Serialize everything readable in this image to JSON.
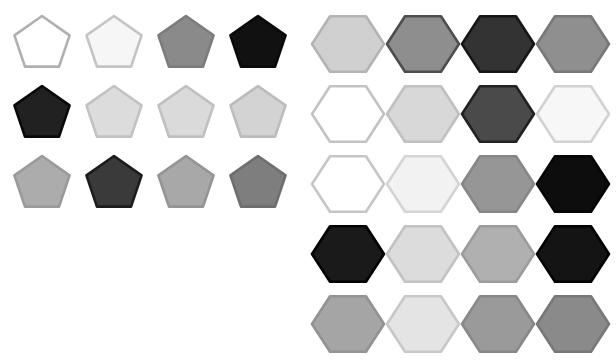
{
  "canvas": {
    "width": 616,
    "height": 362,
    "background": "#ffffff"
  },
  "shape_grids": [
    {
      "name": "pentagon-grid",
      "shape": "pentagon",
      "sides": 5,
      "rows": 3,
      "cols": 4,
      "origin_x": 13,
      "origin_y": 16,
      "cell_w": 72,
      "cell_h": 70,
      "shape_w": 58,
      "shape_h": 56,
      "stroke_width": 2.6,
      "cells": [
        {
          "row": 0,
          "col": 0,
          "fill": "#ffffff",
          "stroke": "#b0b0b0",
          "label": "pentagon-r1c1"
        },
        {
          "row": 0,
          "col": 1,
          "fill": "#f6f6f6",
          "stroke": "#c4c4c4",
          "label": "pentagon-r1c2"
        },
        {
          "row": 0,
          "col": 2,
          "fill": "#8a8a8a",
          "stroke": "#7c7c7c",
          "label": "pentagon-r1c3"
        },
        {
          "row": 0,
          "col": 3,
          "fill": "#111111",
          "stroke": "#0a0a0a",
          "label": "pentagon-r1c4"
        },
        {
          "row": 1,
          "col": 0,
          "fill": "#212121",
          "stroke": "#090909",
          "label": "pentagon-r2c1"
        },
        {
          "row": 1,
          "col": 1,
          "fill": "#dcdcdc",
          "stroke": "#c2c2c2",
          "label": "pentagon-r2c2"
        },
        {
          "row": 1,
          "col": 2,
          "fill": "#dadada",
          "stroke": "#c0c0c0",
          "label": "pentagon-r2c3"
        },
        {
          "row": 1,
          "col": 3,
          "fill": "#d3d3d3",
          "stroke": "#bcbcbc",
          "label": "pentagon-r2c4"
        },
        {
          "row": 2,
          "col": 0,
          "fill": "#acacac",
          "stroke": "#9a9a9a",
          "label": "pentagon-r3c1"
        },
        {
          "row": 2,
          "col": 1,
          "fill": "#3a3a3a",
          "stroke": "#1c1c1c",
          "label": "pentagon-r3c2"
        },
        {
          "row": 2,
          "col": 2,
          "fill": "#a8a8a8",
          "stroke": "#949494",
          "label": "pentagon-r3c3"
        },
        {
          "row": 2,
          "col": 3,
          "fill": "#7e7e7e",
          "stroke": "#6e6e6e",
          "label": "pentagon-r3c4"
        }
      ]
    },
    {
      "name": "hexagon-grid",
      "shape": "hexagon",
      "sides": 6,
      "rows": 5,
      "cols": 4,
      "origin_x": 312,
      "origin_y": 12,
      "cell_w": 75,
      "cell_h": 70,
      "shape_w": 72,
      "shape_h": 64,
      "stroke_width": 2.6,
      "cells": [
        {
          "row": 0,
          "col": 0,
          "fill": "#d0d0d0",
          "stroke": "#b4b4b4",
          "label": "hexagon-r1c1"
        },
        {
          "row": 0,
          "col": 1,
          "fill": "#8e8e8e",
          "stroke": "#4e4e4e",
          "label": "hexagon-r1c2"
        },
        {
          "row": 0,
          "col": 2,
          "fill": "#333333",
          "stroke": "#161616",
          "label": "hexagon-r1c3"
        },
        {
          "row": 0,
          "col": 3,
          "fill": "#8f8f8f",
          "stroke": "#787878",
          "label": "hexagon-r1c4"
        },
        {
          "row": 1,
          "col": 0,
          "fill": "#ffffff",
          "stroke": "#c3c3c3",
          "label": "hexagon-r2c1"
        },
        {
          "row": 1,
          "col": 1,
          "fill": "#d8d8d8",
          "stroke": "#c0c0c0",
          "label": "hexagon-r2c2"
        },
        {
          "row": 1,
          "col": 2,
          "fill": "#4a4a4a",
          "stroke": "#222222",
          "label": "hexagon-r2c3"
        },
        {
          "row": 1,
          "col": 3,
          "fill": "#f7f7f7",
          "stroke": "#d2d2d2",
          "label": "hexagon-r2c4"
        },
        {
          "row": 2,
          "col": 0,
          "fill": "#ffffff",
          "stroke": "#c6c6c6",
          "label": "hexagon-r3c1"
        },
        {
          "row": 2,
          "col": 1,
          "fill": "#f2f2f2",
          "stroke": "#d4d4d4",
          "label": "hexagon-r3c2"
        },
        {
          "row": 2,
          "col": 2,
          "fill": "#969696",
          "stroke": "#868686",
          "label": "hexagon-r3c3"
        },
        {
          "row": 2,
          "col": 3,
          "fill": "#0d0d0d",
          "stroke": "#050505",
          "label": "hexagon-r3c4"
        },
        {
          "row": 3,
          "col": 0,
          "fill": "#1a1a1a",
          "stroke": "#000000",
          "label": "hexagon-r4c1"
        },
        {
          "row": 3,
          "col": 1,
          "fill": "#dcdcdc",
          "stroke": "#c2c2c2",
          "label": "hexagon-r4c2"
        },
        {
          "row": 3,
          "col": 2,
          "fill": "#b0b0b0",
          "stroke": "#9c9c9c",
          "label": "hexagon-r4c3"
        },
        {
          "row": 3,
          "col": 3,
          "fill": "#141414",
          "stroke": "#000000",
          "label": "hexagon-r4c4"
        },
        {
          "row": 4,
          "col": 0,
          "fill": "#a5a5a5",
          "stroke": "#929292",
          "label": "hexagon-r5c1"
        },
        {
          "row": 4,
          "col": 1,
          "fill": "#e4e4e4",
          "stroke": "#c8c8c8",
          "label": "hexagon-r5c2"
        },
        {
          "row": 4,
          "col": 2,
          "fill": "#9a9a9a",
          "stroke": "#888888",
          "label": "hexagon-r5c3"
        },
        {
          "row": 4,
          "col": 3,
          "fill": "#8a8a8a",
          "stroke": "#787878",
          "label": "hexagon-r5c4"
        }
      ]
    }
  ]
}
